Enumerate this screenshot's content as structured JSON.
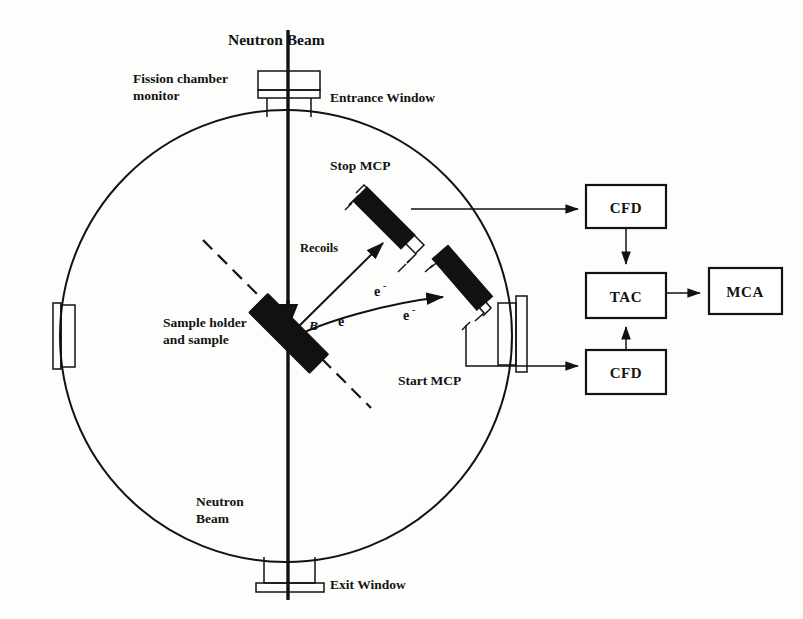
{
  "figure": {
    "labels": {
      "neutron_beam_top": "Neutron Beam",
      "fission_chamber_monitor_line1": "Fission chamber",
      "fission_chamber_monitor_line2": "monitor",
      "entrance_window": "Entrance Window",
      "stop_mcp": "Stop MCP",
      "start_mcp": "Start MCP",
      "recoils": "Recoils",
      "sample_holder_line1": "Sample holder",
      "sample_holder_line2": "and sample",
      "magnetic_field": "B",
      "electron_1": "e",
      "electron_2": "e",
      "electron_3": "e",
      "electron_superscript": "-",
      "neutron_beam_bottom_line1": "Neutron",
      "neutron_beam_bottom_line2": "Beam",
      "exit_window": "Exit Window"
    },
    "electronics": {
      "cfd_top": "CFD",
      "cfd_bottom": "CFD",
      "tac": "TAC",
      "mca": "MCA"
    },
    "colors": {
      "ink": "#121212",
      "detector_fill": "#111111",
      "background": "#fdfdfc"
    }
  }
}
